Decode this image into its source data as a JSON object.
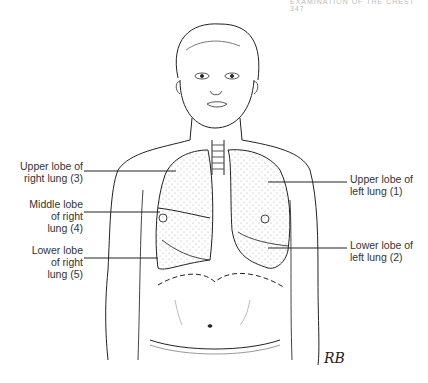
{
  "header": {
    "running_head": "EXAMINATION OF THE CHEST   347"
  },
  "labels": {
    "right_upper": {
      "line1": "Upper lobe of",
      "line2": "right lung (3)"
    },
    "right_middle": {
      "line1": "Middle lobe",
      "line2": "of right",
      "line3": "lung (4)"
    },
    "right_lower": {
      "line1": "Lower lobe",
      "line2": "of right",
      "line3": "lung (5)"
    },
    "left_upper": {
      "line1": "Upper lobe of",
      "line2": "left lung (1)"
    },
    "left_lower": {
      "line1": "Lower lobe of",
      "line2": "left lung (2)"
    }
  },
  "signature": "RB"
}
